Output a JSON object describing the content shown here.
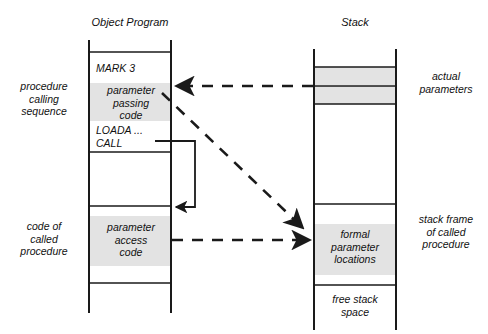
{
  "figure": {
    "title_left": "Object Program",
    "title_right": "Stack"
  },
  "left_column": {
    "side_labels": [
      {
        "id": "procedure-calling-sequence",
        "text": "procedure\ncalling\nsequence"
      },
      {
        "id": "code-of-called-procedure",
        "text": "code of\ncalled\nprocedure"
      }
    ],
    "cells": [
      {
        "id": "mark-3",
        "text": "MARK 3",
        "shaded": false
      },
      {
        "id": "parameter-passing-code",
        "text": "parameter\npassing\ncode",
        "shaded": true
      },
      {
        "id": "loada",
        "text": "LOADA ...",
        "shaded": false
      },
      {
        "id": "call",
        "text": "CALL",
        "shaded": false
      },
      {
        "id": "parameter-access-code",
        "text": "parameter\naccess\ncode",
        "shaded": true
      }
    ]
  },
  "right_column": {
    "side_labels": [
      {
        "id": "actual-parameters",
        "text": "actual\nparameters"
      },
      {
        "id": "stack-frame-of-called-procedure",
        "text": "stack frame\nof called\nprocedure"
      }
    ],
    "cells": [
      {
        "id": "actual-parameter-slot-1",
        "text": "",
        "shaded": true
      },
      {
        "id": "actual-parameter-slot-2",
        "text": "",
        "shaded": true
      },
      {
        "id": "formal-parameter-locations",
        "text": "formal\nparameter\nlocations",
        "shaded": true
      },
      {
        "id": "free-stack-space",
        "text": "free stack\nspace",
        "shaded": false
      }
    ]
  },
  "connectors": [
    {
      "id": "actual-parameters-dashed-arrow",
      "style": "dashed",
      "direction": "right-to-left"
    },
    {
      "id": "parameter-access-dashed-arrow",
      "style": "dashed",
      "direction": "left-to-right"
    },
    {
      "id": "diagonal-binding-dashed-arrow",
      "style": "dashed",
      "direction": "diagonal-down-right"
    },
    {
      "id": "call-control-flow-arrow",
      "style": "solid",
      "direction": "call-jump"
    }
  ],
  "colors": {
    "stroke": "#1a1a1a",
    "shade_fill": "#e3e3e3",
    "background": "#ffffff"
  }
}
